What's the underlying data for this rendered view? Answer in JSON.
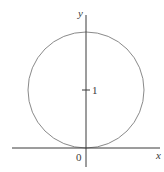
{
  "diagram": {
    "type": "circle-on-axes",
    "axes": {
      "x_label": "x",
      "y_label": "y",
      "origin_label": "0"
    },
    "ticks": [
      {
        "axis": "y",
        "value": 1,
        "label": "1"
      }
    ],
    "circle": {
      "center": [
        0,
        1
      ],
      "radius": 1,
      "stroke_color": "#8a8a8a"
    },
    "colors": {
      "axes": "#3a3a3a",
      "background": "#ffffff"
    }
  }
}
